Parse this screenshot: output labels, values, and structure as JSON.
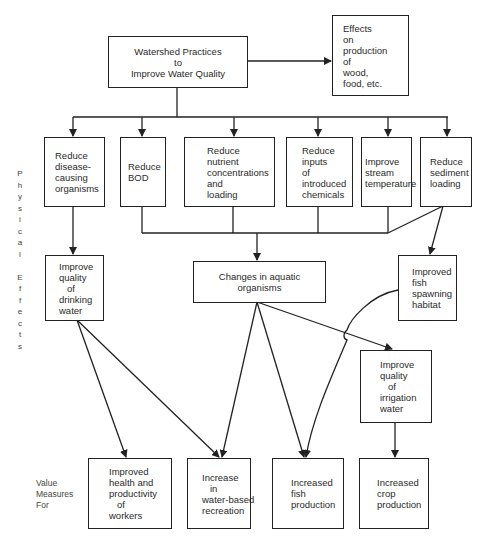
{
  "diagram": {
    "side_labels": {
      "physical_effects": "P\nh\ny\ns\ni\nc\na\nl\n\nE\nf\nf\ne\nc\nt\ns",
      "value_measures": "Value\nMeasures\nFor"
    },
    "nodes": {
      "root": "Watershed Practices\nto\nImprove Water Quality",
      "effects_production": "Effects\non\nproduction\nof\nwood,\nfood, etc.",
      "reduce_disease": "Reduce\ndisease-\ncausing\norganisms",
      "reduce_bod": "Reduce\nBOD",
      "reduce_nutrient": "Reduce\nnutrient\nconcentrations\nand\nloading",
      "reduce_inputs": "Reduce\ninputs\nof\nintroduced\nchemicals",
      "improve_stream_temp": "Improve\nstream\ntemperature",
      "reduce_sediment": "Reduce\nsediment\nloading",
      "improve_drinking": "Improve\nquality\n   of\ndrinking\nwater",
      "changes_aquatic": "Changes in aquatic\norganisms",
      "fish_spawning": "Improved\nfish\nspawning\nhabitat",
      "improve_irrigation": "Improve\nquality\n   of\nirrigation\nwater",
      "health_workers": "Improved\nhealth and\nproductivity\n   of\nworkers",
      "water_recreation": "Increase\n   in\nwater-based\nrecreation",
      "fish_production": "Increased\nfish\nproduction",
      "crop_production": "Increased\ncrop\nproduction"
    },
    "edges": [
      [
        "root",
        "effects_production"
      ],
      [
        "root",
        "reduce_disease"
      ],
      [
        "root",
        "reduce_bod"
      ],
      [
        "root",
        "reduce_nutrient"
      ],
      [
        "root",
        "reduce_inputs"
      ],
      [
        "root",
        "improve_stream_temp"
      ],
      [
        "root",
        "reduce_sediment"
      ],
      [
        "reduce_disease",
        "improve_drinking"
      ],
      [
        "reduce_bod",
        "changes_aquatic"
      ],
      [
        "reduce_nutrient",
        "changes_aquatic"
      ],
      [
        "reduce_inputs",
        "changes_aquatic"
      ],
      [
        "improve_stream_temp",
        "changes_aquatic"
      ],
      [
        "reduce_sediment",
        "changes_aquatic"
      ],
      [
        "reduce_sediment",
        "fish_spawning"
      ],
      [
        "improve_drinking",
        "health_workers"
      ],
      [
        "improve_drinking",
        "water_recreation"
      ],
      [
        "changes_aquatic",
        "water_recreation"
      ],
      [
        "changes_aquatic",
        "fish_production"
      ],
      [
        "changes_aquatic",
        "improve_irrigation"
      ],
      [
        "fish_spawning",
        "fish_production"
      ],
      [
        "improve_irrigation",
        "crop_production"
      ]
    ],
    "line_color": "#222222"
  }
}
